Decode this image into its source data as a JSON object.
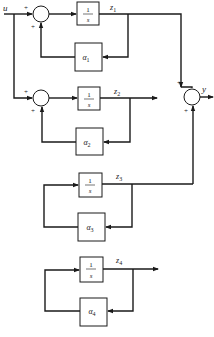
{
  "diagram": {
    "input_label": "u",
    "output_label": "y",
    "sign": "+",
    "integrator": {
      "numerator": "1",
      "denominator": "s"
    },
    "channels": [
      {
        "state": "z",
        "state_sub": "1",
        "gain": "α",
        "gain_sub": "1",
        "has_input": true,
        "to_output": true
      },
      {
        "state": "z",
        "state_sub": "2",
        "gain": "α",
        "gain_sub": "2",
        "has_input": true,
        "to_output": false
      },
      {
        "state": "z",
        "state_sub": "3",
        "gain": "α",
        "gain_sub": "3",
        "has_input": false,
        "to_output": true
      },
      {
        "state": "z",
        "state_sub": "4",
        "gain": "α",
        "gain_sub": "4",
        "has_input": false,
        "to_output": false
      }
    ],
    "colors": {
      "line": "#1a1a1a",
      "background": "#ffffff"
    }
  }
}
